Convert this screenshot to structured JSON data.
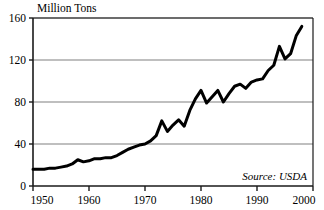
{
  "chart_data": {
    "type": "line",
    "title": "",
    "ylabel": "Million Tons",
    "xlabel": "",
    "ylim": [
      0,
      160
    ],
    "xlim": [
      1950,
      2000
    ],
    "yticks": [
      0,
      40,
      80,
      120,
      160
    ],
    "xticks": [
      1950,
      1960,
      1970,
      1980,
      1990,
      2000
    ],
    "ytick_labels": [
      "0",
      "40",
      "80",
      "120",
      "160"
    ],
    "xtick_labels": [
      "1950",
      "1960",
      "1970",
      "1980",
      "1990",
      "2000"
    ],
    "grid": "horizontal",
    "legend": "none",
    "annotation": "Source: USDA",
    "line_color": "#000000",
    "grid_color": "#808080",
    "axis_color": "#1a1a1a",
    "background_color": "#ffffff",
    "x": [
      1950,
      1951,
      1952,
      1953,
      1954,
      1955,
      1956,
      1957,
      1958,
      1959,
      1960,
      1961,
      1962,
      1963,
      1964,
      1965,
      1966,
      1967,
      1968,
      1969,
      1970,
      1971,
      1972,
      1973,
      1974,
      1975,
      1976,
      1977,
      1978,
      1979,
      1980,
      1981,
      1982,
      1983,
      1984,
      1985,
      1986,
      1987,
      1988,
      1989,
      1990,
      1991,
      1992,
      1993,
      1994,
      1995,
      1996,
      1997,
      1998
    ],
    "series": [
      {
        "name": "Production",
        "values": [
          16,
          16,
          16,
          17,
          17,
          18,
          19,
          21,
          25,
          23,
          24,
          26,
          26,
          27,
          27,
          29,
          32,
          35,
          37,
          39,
          40,
          43,
          48,
          62,
          52,
          58,
          63,
          57,
          72,
          83,
          91,
          79,
          85,
          91,
          80,
          88,
          95,
          97,
          93,
          99,
          101,
          102,
          110,
          115,
          133,
          121,
          126,
          143,
          152
        ]
      }
    ]
  },
  "plot": {
    "left": 33,
    "right": 313,
    "top": 18,
    "bottom": 186
  }
}
